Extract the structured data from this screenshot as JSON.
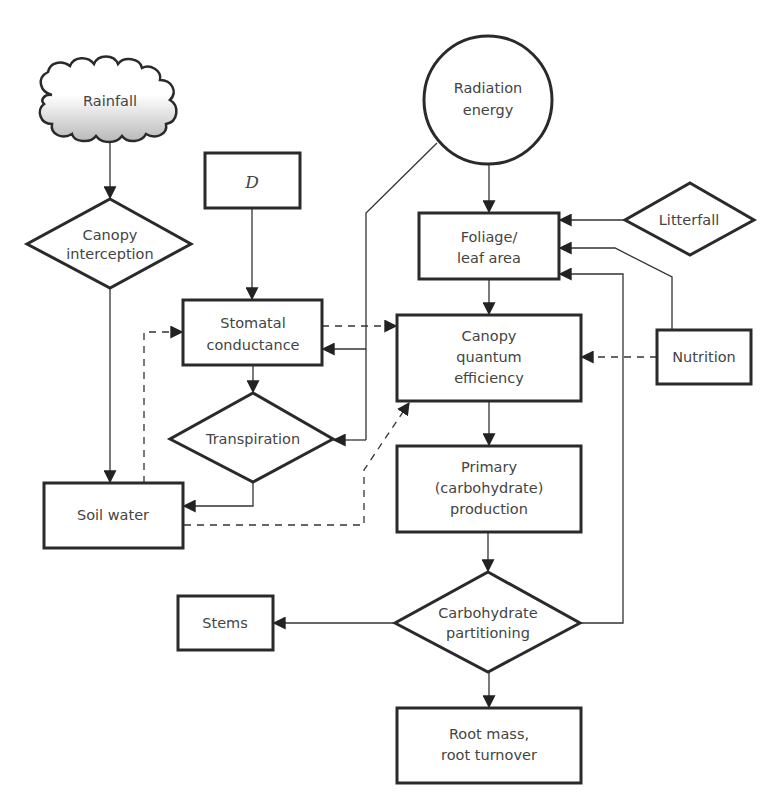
{
  "figure": {
    "colors": {
      "stroke": "#2a2a2a",
      "text": "#444444",
      "background": "#ffffff",
      "cloud_shade": "#bdbdbd"
    }
  },
  "nodes": {
    "rainfall": {
      "label": "Rainfall",
      "shape": "cloud"
    },
    "canopy_interception": {
      "line1": "Canopy",
      "line2": "interception",
      "shape": "diamond"
    },
    "d": {
      "label": "D",
      "shape": "box"
    },
    "radiation_energy": {
      "line1": "Radiation",
      "line2": "energy",
      "shape": "circle"
    },
    "foliage": {
      "line1": "Foliage/",
      "line2": "leaf area",
      "shape": "box"
    },
    "litterfall": {
      "label": "Litterfall",
      "shape": "diamond"
    },
    "stomatal_conductance": {
      "line1": "Stomatal",
      "line2": "conductance",
      "shape": "box"
    },
    "canopy_quantum_efficiency": {
      "line1": "Canopy",
      "line2": "quantum",
      "line3": "efficiency",
      "shape": "box"
    },
    "nutrition": {
      "label": "Nutrition",
      "shape": "box"
    },
    "transpiration": {
      "label": "Transpiration",
      "shape": "diamond"
    },
    "soil_water": {
      "label": "Soil water",
      "shape": "box"
    },
    "primary_production": {
      "line1": "Primary",
      "line2": "(carbohydrate)",
      "line3": "production",
      "shape": "box"
    },
    "carbohydrate_partitioning": {
      "line1": "Carbohydrate",
      "line2": "partitioning",
      "shape": "diamond"
    },
    "stems": {
      "label": "Stems",
      "shape": "box"
    },
    "root_mass": {
      "line1": "Root mass,",
      "line2": "root turnover",
      "shape": "box"
    }
  },
  "edges": [
    {
      "from": "Rainfall",
      "to": "Canopy interception",
      "style": "solid"
    },
    {
      "from": "Canopy interception",
      "to": "Soil water",
      "style": "solid"
    },
    {
      "from": "D",
      "to": "Stomatal conductance",
      "style": "solid"
    },
    {
      "from": "Radiation energy",
      "to": "Foliage/leaf area",
      "style": "solid"
    },
    {
      "from": "Radiation energy",
      "to": "Stomatal conductance",
      "style": "solid"
    },
    {
      "from": "Radiation energy",
      "to": "Transpiration",
      "style": "solid"
    },
    {
      "from": "Litterfall",
      "to": "Foliage/leaf area",
      "style": "solid"
    },
    {
      "from": "Nutrition",
      "to": "Foliage/leaf area",
      "style": "solid"
    },
    {
      "from": "Nutrition",
      "to": "Canopy quantum efficiency",
      "style": "dashed"
    },
    {
      "from": "Carbohydrate partitioning",
      "to": "Foliage/leaf area",
      "style": "solid"
    },
    {
      "from": "Foliage/leaf area",
      "to": "Canopy quantum efficiency",
      "style": "solid"
    },
    {
      "from": "Stomatal conductance",
      "to": "Canopy quantum efficiency",
      "style": "dashed"
    },
    {
      "from": "Stomatal conductance",
      "to": "Transpiration",
      "style": "solid"
    },
    {
      "from": "Soil water",
      "to": "Stomatal conductance",
      "style": "dashed"
    },
    {
      "from": "Transpiration",
      "to": "Soil water",
      "style": "solid"
    },
    {
      "from": "Soil water",
      "to": "Canopy quantum efficiency",
      "style": "dashed"
    },
    {
      "from": "Canopy quantum efficiency",
      "to": "Primary (carbohydrate) production",
      "style": "solid"
    },
    {
      "from": "Primary (carbohydrate) production",
      "to": "Carbohydrate partitioning",
      "style": "solid"
    },
    {
      "from": "Carbohydrate partitioning",
      "to": "Stems",
      "style": "solid"
    },
    {
      "from": "Carbohydrate partitioning",
      "to": "Root mass, root turnover",
      "style": "solid"
    }
  ]
}
